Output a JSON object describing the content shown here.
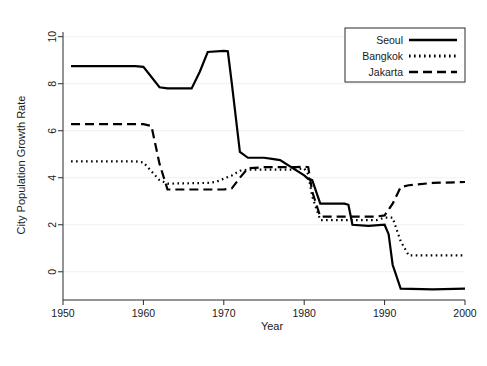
{
  "chart_data": {
    "type": "line",
    "title": "",
    "xlabel": "Year",
    "ylabel": "City Population Growth Rate",
    "xlim": [
      1950,
      2000
    ],
    "ylim": [
      -1.2,
      10.2
    ],
    "xticks": [
      "1950",
      "1960",
      "1970",
      "1980",
      "1990",
      "2000"
    ],
    "xtick_values": [
      1950,
      1960,
      1970,
      1980,
      1990,
      2000
    ],
    "yticks": [
      "0",
      "2",
      "4",
      "6",
      "8",
      "10"
    ],
    "ytick_values": [
      0,
      2,
      4,
      6,
      8,
      10
    ],
    "grid": "horizontal-light",
    "legend_position": "top-right",
    "series": [
      {
        "name": "Seoul",
        "style": "solid",
        "x": [
          1951,
          1959,
          1960,
          1962,
          1963,
          1966,
          1967,
          1968,
          1970,
          1970.5,
          1971,
          1972,
          1973,
          1975,
          1976,
          1977,
          1980,
          1980.5,
          1981,
          1982,
          1985,
          1985.5,
          1986,
          1988,
          1990,
          1990.5,
          1991,
          1992,
          1996,
          2000
        ],
        "y": [
          8.75,
          8.75,
          8.72,
          7.85,
          7.8,
          7.8,
          8.5,
          9.35,
          9.4,
          9.38,
          8.0,
          5.1,
          4.85,
          4.85,
          4.8,
          4.75,
          4.1,
          3.95,
          3.9,
          2.9,
          2.9,
          2.85,
          2.0,
          1.95,
          2.0,
          1.6,
          0.3,
          -0.72,
          -0.75,
          -0.72
        ]
      },
      {
        "name": "Bangkok",
        "style": "dotted",
        "x": [
          1951,
          1959,
          1960,
          1962,
          1963,
          1968,
          1969,
          1971,
          1972,
          1973,
          1975,
          1979,
          1980,
          1980.5,
          1981,
          1982,
          1983,
          1989,
          1990,
          1991,
          1992,
          1993,
          2000
        ],
        "y": [
          4.7,
          4.7,
          4.65,
          3.9,
          3.75,
          3.78,
          3.82,
          4.1,
          4.3,
          4.35,
          4.35,
          4.35,
          4.4,
          4.15,
          3.2,
          2.2,
          2.2,
          2.2,
          2.3,
          2.3,
          1.3,
          0.7,
          0.7
        ]
      },
      {
        "name": "Jakarta",
        "style": "dashed",
        "x": [
          1951,
          1960,
          1961,
          1962,
          1963,
          1970,
          1971,
          1972,
          1973,
          1975,
          1979,
          1980,
          1980.5,
          1981,
          1982,
          1989,
          1990,
          1991,
          1992,
          1993,
          1996,
          2000
        ],
        "y": [
          6.28,
          6.28,
          6.2,
          4.6,
          3.5,
          3.5,
          3.55,
          4.0,
          4.4,
          4.45,
          4.45,
          4.48,
          4.45,
          3.4,
          2.35,
          2.35,
          2.4,
          2.9,
          3.6,
          3.68,
          3.78,
          3.82
        ]
      }
    ]
  },
  "legend": {
    "items": [
      {
        "label": "Seoul",
        "style": "solid"
      },
      {
        "label": "Bangkok",
        "style": "dotted"
      },
      {
        "label": "Jakarta",
        "style": "dashed"
      }
    ]
  },
  "colors": {
    "line": "#000000",
    "axis": "#2a2a2a",
    "grid": "#f0f0f0",
    "background": "#ffffff"
  }
}
